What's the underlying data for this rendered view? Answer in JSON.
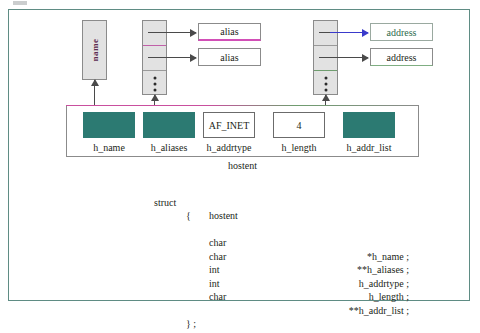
{
  "figure": {
    "caption": "hostent"
  },
  "colors": {
    "frame_border": "#5f8c84",
    "field_fill_teal": "#2c7a72",
    "array_fill_gray": "#e2e2e2",
    "accent_magenta": "#d24fb7",
    "accent_blue": "#3a3acb",
    "accent_green": "#2d6b4c",
    "text": "#231f20"
  },
  "diagram": {
    "name_string": {
      "label": "name",
      "orientation": "vertical"
    },
    "aliases_array": {
      "cells": [
        "pointer",
        "pointer",
        "ellipsis"
      ],
      "ellipsis": "⋮"
    },
    "addr_list_array": {
      "cells": [
        "pointer",
        "pointer",
        "ellipsis"
      ],
      "ellipsis": "⋮"
    },
    "alias_boxes": [
      {
        "label": "alias"
      },
      {
        "label": "alias"
      }
    ],
    "address_boxes": [
      {
        "label": "address"
      },
      {
        "label": "address"
      }
    ],
    "struct_fields": [
      {
        "name": "h_name",
        "label": "h_name",
        "value": "",
        "style": "filled"
      },
      {
        "name": "h_aliases",
        "label": "h_aliases",
        "value": "",
        "style": "filled"
      },
      {
        "name": "h_addrtype",
        "label": "h_addrtype",
        "value": "AF_INET",
        "style": "outlined"
      },
      {
        "name": "h_length",
        "label": "h_length",
        "value": "4",
        "style": "outlined"
      },
      {
        "name": "h_addr_list",
        "label": "h_addr_list",
        "value": "",
        "style": "filled"
      }
    ]
  },
  "code": {
    "header_keyword": "struct",
    "header_name": "hostent",
    "open_brace": "{",
    "close_brace": "} ;",
    "members": [
      {
        "type": "char",
        "name": "*h_name ;"
      },
      {
        "type": "char",
        "name": "**h_aliases ;"
      },
      {
        "type": "int",
        "name": "h_addrtype ;"
      },
      {
        "type": "int",
        "name": "h_length ;"
      },
      {
        "type": "char",
        "name": "**h_addr_list ;"
      }
    ]
  }
}
